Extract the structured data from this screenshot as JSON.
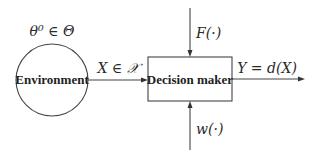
{
  "diagram": {
    "type": "block-diagram",
    "nodes": {
      "environment": {
        "label": "Environment",
        "shape": "circle",
        "parameter_label": "θ⁰ ∈ Θ"
      },
      "decision_maker": {
        "label": "Decision maker",
        "shape": "rectangle"
      }
    },
    "edges": {
      "observation": {
        "from": "Environment",
        "to": "Decision maker",
        "label": "X ∈ 𝒳"
      },
      "output": {
        "from": "Decision maker",
        "label": "Y = d(X)"
      },
      "top_input": {
        "to": "Decision maker",
        "label": "F(·)"
      },
      "bottom_input": {
        "to": "Decision maker",
        "label": "w(·)"
      }
    },
    "colors": {
      "stroke": "#444444",
      "text": "#222222",
      "background": "#ffffff"
    }
  }
}
